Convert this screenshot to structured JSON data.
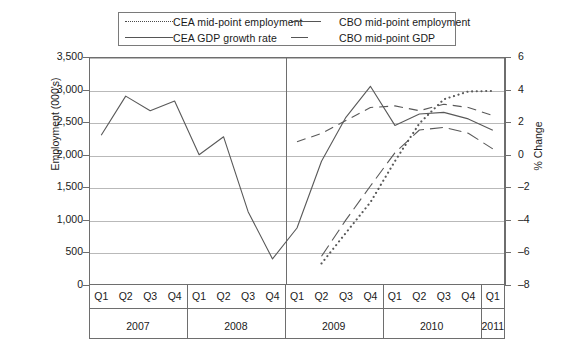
{
  "legend": {
    "items": [
      {
        "label": "CEA mid-point employment",
        "key": "dotted",
        "icon": "dotted-line-swatch"
      },
      {
        "label": "CBO mid-point employment",
        "key": "long-dash",
        "icon": "long-dash-line-swatch"
      },
      {
        "label": "CEA GDP growth rate",
        "key": "solid",
        "icon": "solid-line-swatch"
      },
      {
        "label": "CBO mid-point GDP",
        "key": "dashed",
        "icon": "dashed-line-swatch"
      }
    ]
  },
  "axes": {
    "left": {
      "title": "Employment (000's)",
      "ticks": [
        "0",
        "500",
        "1,000",
        "1,500",
        "2,000",
        "2,500",
        "3,000",
        "3,500"
      ],
      "min": 0,
      "max": 3500,
      "step": 500
    },
    "right": {
      "title": "% Change",
      "ticks": [
        "–8",
        "–6",
        "–4",
        "–2",
        "0",
        "2",
        "4",
        "6"
      ],
      "min": -8,
      "max": 6,
      "step": 2
    },
    "x": {
      "quarters": [
        "Q1",
        "Q2",
        "Q3",
        "Q4",
        "Q1",
        "Q2",
        "Q3",
        "Q4",
        "Q1",
        "Q2",
        "Q3",
        "Q4",
        "Q1",
        "Q2",
        "Q3",
        "Q4",
        "Q1"
      ],
      "years": [
        "2007",
        "2008",
        "2009",
        "2010",
        "2011"
      ],
      "forecast_start": "Q1 2009"
    }
  },
  "chart_data": {
    "type": "line",
    "title": "",
    "xlabel": "",
    "ylabel": "Employment (000's)",
    "y2label": "% Change",
    "ylim": [
      0,
      3500
    ],
    "y2lim": [
      -8,
      6
    ],
    "grid": true,
    "legend_position": "top",
    "x": [
      "2007Q1",
      "2007Q2",
      "2007Q3",
      "2007Q4",
      "2008Q1",
      "2008Q2",
      "2008Q3",
      "2008Q4",
      "2009Q1",
      "2009Q2",
      "2009Q3",
      "2009Q4",
      "2010Q1",
      "2010Q2",
      "2010Q3",
      "2010Q4",
      "2011Q1"
    ],
    "series": [
      {
        "name": "CEA GDP growth rate",
        "axis": "right",
        "style": "solid",
        "x": [
          "2007Q1",
          "2007Q2",
          "2007Q3",
          "2007Q4",
          "2008Q1",
          "2008Q2",
          "2008Q3",
          "2008Q4",
          "2009Q1",
          "2009Q2",
          "2009Q3",
          "2009Q4",
          "2010Q1",
          "2010Q2",
          "2010Q3",
          "2010Q4",
          "2011Q1"
        ],
        "values": [
          1.2,
          3.6,
          2.7,
          3.3,
          0.0,
          1.1,
          -3.5,
          -6.4,
          -4.5,
          -0.4,
          2.3,
          4.2,
          1.8,
          2.5,
          2.6,
          2.2,
          1.5
        ]
      },
      {
        "name": "CEA mid-point employment",
        "axis": "left",
        "style": "dotted",
        "x": [
          "2009Q2",
          "2009Q3",
          "2009Q4",
          "2010Q1",
          "2010Q2",
          "2010Q3",
          "2010Q4",
          "2011Q1"
        ],
        "values": [
          330,
          800,
          1270,
          1900,
          2480,
          2850,
          2970,
          2980
        ]
      },
      {
        "name": "CBO mid-point employment",
        "axis": "left",
        "style": "long-dash",
        "x": [
          "2009Q2",
          "2009Q3",
          "2009Q4",
          "2010Q1",
          "2010Q2",
          "2010Q3",
          "2010Q4",
          "2011Q1"
        ],
        "values": [
          440,
          1000,
          1520,
          2030,
          2380,
          2420,
          2330,
          2090
        ]
      },
      {
        "name": "CBO mid-point GDP",
        "axis": "right",
        "style": "dashed",
        "x": [
          "2009Q1",
          "2009Q2",
          "2009Q3",
          "2009Q4",
          "2010Q1",
          "2010Q2",
          "2010Q3",
          "2010Q4",
          "2011Q1"
        ],
        "values": [
          0.8,
          1.3,
          2.1,
          2.9,
          3.0,
          2.7,
          3.1,
          2.9,
          2.4
        ]
      }
    ],
    "annotations": [
      {
        "type": "vertical-divider",
        "at": "2009Q1",
        "note": "history / projection boundary"
      }
    ]
  }
}
